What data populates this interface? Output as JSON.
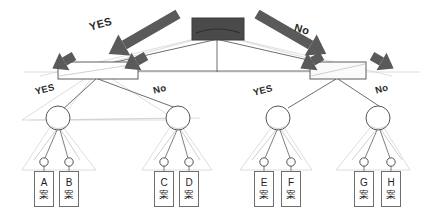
{
  "diagram": {
    "colors": {
      "root_fill": "#4a4a4a",
      "arrow_fill": "#5a5a5a",
      "line": "#5d5d5d",
      "ghost_line": "#c9c9c9",
      "node_stroke": "#555555",
      "box_stroke": "#6e6e6e",
      "background": "#ffffff",
      "text": "#2b2b2b"
    },
    "root": {
      "name": "root-node",
      "shape": "filled-rectangle"
    },
    "level1_branch_labels": [
      {
        "text": "YES",
        "side": "left"
      },
      {
        "text": "No",
        "side": "right"
      }
    ],
    "level1_nodes": [
      {
        "name": "node-left",
        "shape": "rectangle"
      },
      {
        "name": "node-right",
        "shape": "rectangle"
      }
    ],
    "level2_branch_labels": [
      {
        "text": "YES",
        "parent": "left"
      },
      {
        "text": "No",
        "parent": "left"
      },
      {
        "text": "YES",
        "parent": "right"
      },
      {
        "text": "No",
        "parent": "right"
      }
    ],
    "level2_nodes": [
      {
        "name": "circle-node-1"
      },
      {
        "name": "circle-node-2"
      },
      {
        "name": "circle-node-3"
      },
      {
        "name": "circle-node-4"
      }
    ],
    "leaves": [
      {
        "letter": "A",
        "kanji": "案"
      },
      {
        "letter": "B",
        "kanji": "案"
      },
      {
        "letter": "C",
        "kanji": "案"
      },
      {
        "letter": "D",
        "kanji": "案"
      },
      {
        "letter": "E",
        "kanji": "案"
      },
      {
        "letter": "F",
        "kanji": "案"
      },
      {
        "letter": "G",
        "kanji": "案"
      },
      {
        "letter": "H",
        "kanji": "案"
      }
    ],
    "arrows": [
      {
        "name": "arrow-root-yes",
        "direction": "down-left"
      },
      {
        "name": "arrow-root-no",
        "direction": "down-right"
      },
      {
        "name": "arrow-left-outer",
        "direction": "down-left"
      },
      {
        "name": "arrow-left-inner",
        "direction": "down-left"
      },
      {
        "name": "arrow-right-inner",
        "direction": "down-left"
      },
      {
        "name": "arrow-right-outer",
        "direction": "down-right"
      }
    ]
  }
}
